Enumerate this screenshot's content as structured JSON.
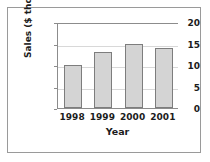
{
  "chart_data": {
    "type": "bar",
    "title": "",
    "subtitle": "",
    "xlabel": "Year",
    "ylabel": "Sales ($ thousands)",
    "categories": [
      "1998",
      "1999",
      "2000",
      "2001"
    ],
    "values": [
      10,
      13,
      15,
      14
    ],
    "ylim": [
      0,
      20
    ],
    "yticks": [
      0,
      5,
      10,
      15,
      20
    ],
    "ytick_labels": [
      "0",
      "5",
      "10",
      "15",
      "20"
    ],
    "grid": true,
    "grid_axis": "y",
    "legend": false,
    "legend_position": "none",
    "annotations": [],
    "series": [
      {
        "name": "Sales",
        "values": [
          10,
          13,
          15,
          14
        ]
      }
    ]
  },
  "style": {
    "bar_fill": "#d4d4d4",
    "bar_edge": "#7d7d7d",
    "grid_color": "#d8d8d8",
    "axis_color": "#8c8c8c",
    "frame_color": "#9a9a9a",
    "text_color": "#1c1c1c",
    "background": "#ffffff"
  }
}
